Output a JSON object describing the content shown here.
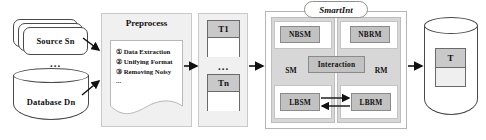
{
  "diagram": {
    "colors": {
      "panel_fill": "#f0f0f0",
      "column_fill": "#d7d7d7",
      "node_fill": "#c2c2c2",
      "table_header_fill": "#c9c9c9",
      "stroke": "#4a4a4a",
      "arrow": "#111111"
    },
    "sources": {
      "stack_label": "Source Sn",
      "ellipsis": "...",
      "database_label": "Database Dn"
    },
    "preprocess": {
      "title": "Preprocess",
      "steps": [
        "① Data Extraction",
        "② Unifying Format",
        "③ Removing Noisy"
      ],
      "more": "..."
    },
    "tables": {
      "first_label": "T1",
      "ellipsis": "...",
      "last_label": "Tn"
    },
    "smartint": {
      "title": "SmartInt",
      "left_column_label": "SM",
      "right_column_label": "RM",
      "interaction_label": "Interaction",
      "nodes": {
        "top_left": "NBSM",
        "top_right": "NBRM",
        "bottom_left": "LBSM",
        "bottom_right": "LBRM"
      }
    },
    "output": {
      "table_label": "T"
    }
  }
}
